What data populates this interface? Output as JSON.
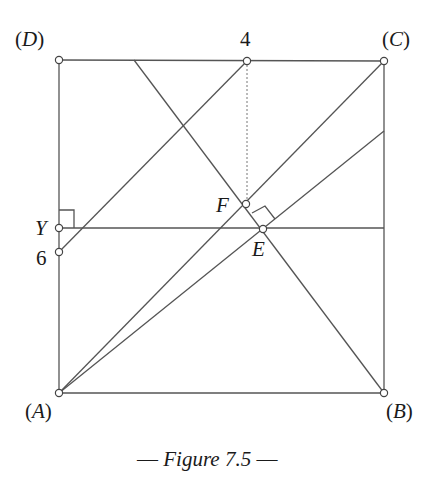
{
  "figure": {
    "caption": "— Figure 7.5 —",
    "caption_parts": {
      "dash_left": "—",
      "title": "Figure 7.5",
      "dash_right": "—"
    },
    "line_color": "#555555",
    "text_color": "#1a1a1a"
  },
  "points": {
    "A": {
      "label": "(A)",
      "letter": "A",
      "x": 59,
      "y": 393
    },
    "B": {
      "label": "(B)",
      "letter": "B",
      "x": 384,
      "y": 393
    },
    "C": {
      "label": "(C)",
      "letter": "C",
      "x": 384,
      "y": 61
    },
    "D": {
      "label": "(D)",
      "letter": "D",
      "x": 59,
      "y": 60
    },
    "four": {
      "label": "4",
      "x": 247,
      "y": 61
    },
    "six": {
      "label": "6",
      "x": 59,
      "y": 252
    },
    "Y": {
      "label": "Y",
      "x": 59,
      "y": 228
    },
    "F": {
      "label": "F",
      "x": 246,
      "y": 204
    },
    "E": {
      "label": "E",
      "x": 263,
      "y": 229
    }
  },
  "segments": [
    {
      "name": "side-DC",
      "from": "D",
      "to": "C"
    },
    {
      "name": "side-CB",
      "from": "C",
      "to": "B"
    },
    {
      "name": "side-BA",
      "from": "B",
      "to": "A"
    },
    {
      "name": "side-AD",
      "from": "A",
      "to": "D"
    },
    {
      "name": "diagonal-AC",
      "from": "A",
      "to": "C"
    },
    {
      "name": "line-six-four",
      "from": "six",
      "to": "four"
    },
    {
      "name": "line-top-to-B",
      "from": [
        134,
        60
      ],
      "to": "B"
    },
    {
      "name": "line-A-to-BC",
      "from": "A",
      "to": [
        384,
        131
      ]
    },
    {
      "name": "line-Y-horizontal",
      "from": "Y",
      "to": [
        384,
        228
      ]
    },
    {
      "name": "dashed-four-F",
      "from": "four",
      "to": "F",
      "dashed": true
    }
  ],
  "right_angle_marks": [
    {
      "at": "Y"
    },
    {
      "at": "E"
    }
  ]
}
